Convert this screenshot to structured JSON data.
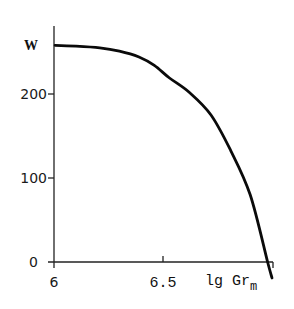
{
  "chart_data": {
    "type": "line",
    "title": "",
    "xlabel": "lg Gr",
    "xlabel_subscript": "m",
    "ylabel": "W",
    "xlim": [
      6,
      7.0
    ],
    "ylim": [
      0,
      260
    ],
    "x_ticks": [
      {
        "value": 6,
        "label": "6"
      },
      {
        "value": 6.5,
        "label": "6.5"
      }
    ],
    "y_ticks": [
      {
        "value": 0,
        "label": "0"
      },
      {
        "value": 100,
        "label": "100"
      },
      {
        "value": 200,
        "label": "200"
      }
    ],
    "grid": false,
    "legend": "none",
    "series": [
      {
        "name": "W",
        "x": [
          6.005,
          6.1,
          6.21,
          6.3,
          6.39,
          6.46,
          6.53,
          6.62,
          6.72,
          6.81,
          6.9,
          6.98,
          7.0
        ],
        "y": [
          258,
          257,
          255,
          251,
          244,
          234,
          219,
          202,
          175,
          133,
          80,
          0,
          -19
        ]
      }
    ]
  }
}
